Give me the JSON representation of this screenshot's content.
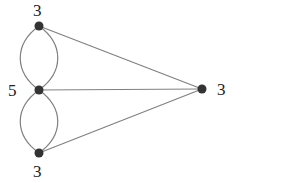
{
  "diagram": {
    "type": "multigraph",
    "edge_color": "#808080",
    "node_color": "#333333",
    "nodes": [
      {
        "id": "top",
        "x": 39,
        "y": 26,
        "degree_label": "3",
        "label_x": 33,
        "label_y": 2
      },
      {
        "id": "middle",
        "x": 39,
        "y": 90,
        "degree_label": "5",
        "label_x": 8,
        "label_y": 82
      },
      {
        "id": "bottom",
        "x": 39,
        "y": 153,
        "degree_label": "3",
        "label_x": 33,
        "label_y": 163
      },
      {
        "id": "right",
        "x": 202,
        "y": 89,
        "degree_label": "3",
        "label_x": 217,
        "label_y": 81
      }
    ],
    "edges": [
      {
        "from": "top",
        "to": "middle",
        "curve": "left"
      },
      {
        "from": "top",
        "to": "middle",
        "curve": "right"
      },
      {
        "from": "middle",
        "to": "bottom",
        "curve": "left"
      },
      {
        "from": "middle",
        "to": "bottom",
        "curve": "right"
      },
      {
        "from": "top",
        "to": "right",
        "curve": "straight"
      },
      {
        "from": "middle",
        "to": "right",
        "curve": "straight"
      },
      {
        "from": "bottom",
        "to": "right",
        "curve": "straight"
      }
    ]
  }
}
